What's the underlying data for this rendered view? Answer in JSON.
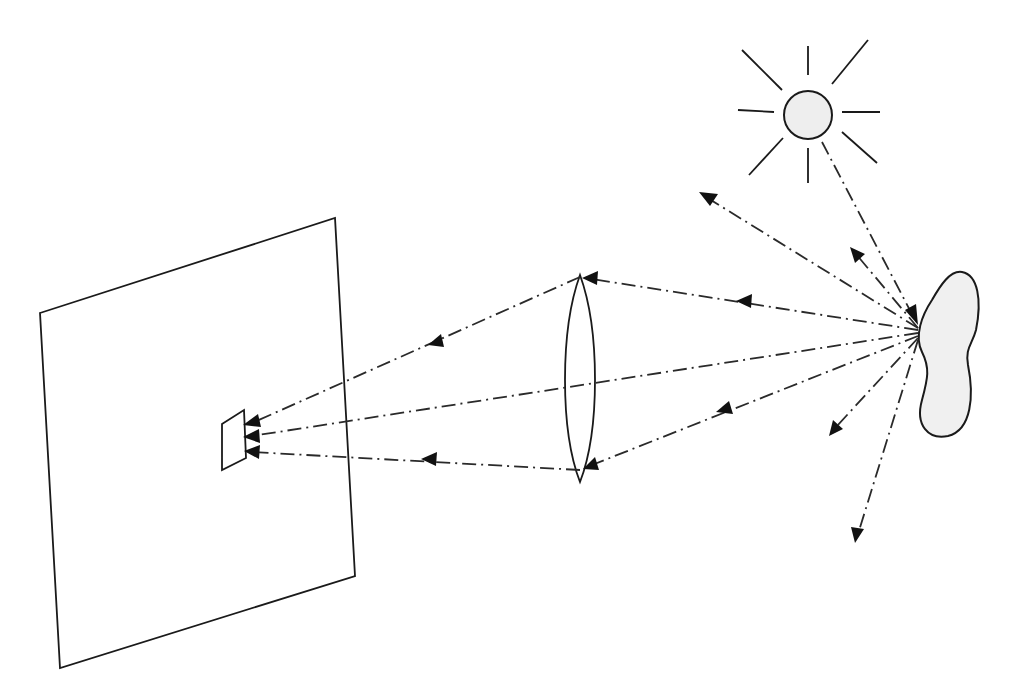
{
  "diagram": {
    "title": "",
    "colors": {
      "line": "#1a1a1a",
      "ray": "#2a2a2a",
      "sun_fill": "#eeeeee",
      "object_fill": "#f0f0f0",
      "background": "#ffffff"
    },
    "elements": {
      "sun": {
        "name": "light-source-sun",
        "cx": 808,
        "cy": 115,
        "r": 26
      },
      "object": {
        "name": "illuminated-object"
      },
      "lens": {
        "name": "convex-lens",
        "x": 580,
        "top": 275,
        "bottom": 482
      },
      "screen": {
        "name": "image-plane-screen",
        "points": "40,313 335,218 355,576 60,668"
      },
      "image": {
        "name": "projected-image",
        "points": "222,424 244,410 246,458 222,470"
      }
    },
    "rays": [
      {
        "name": "incident-ray",
        "from": [
          822,
          142
        ],
        "to": [
          918,
          325
        ]
      },
      {
        "name": "scattered-ray-up-left",
        "from": [
          918,
          328
        ],
        "to": [
          699,
          193
        ]
      },
      {
        "name": "scattered-ray-up",
        "from": [
          918,
          328
        ],
        "to": [
          851,
          248
        ]
      },
      {
        "name": "ray-to-lens-top",
        "from": [
          918,
          330
        ],
        "to": [
          580,
          277
        ]
      },
      {
        "name": "ray-through-lens-center",
        "from": [
          918,
          333
        ],
        "to": [
          245,
          437
        ]
      },
      {
        "name": "ray-to-lens-bottom",
        "from": [
          918,
          336
        ],
        "to": [
          580,
          470
        ]
      },
      {
        "name": "scattered-ray-down-left",
        "from": [
          918,
          338
        ],
        "to": [
          831,
          433
        ]
      },
      {
        "name": "scattered-ray-down",
        "from": [
          918,
          340
        ],
        "to": [
          856,
          542
        ]
      },
      {
        "name": "refracted-ray-top",
        "from": [
          580,
          277
        ],
        "to": [
          245,
          424
        ]
      },
      {
        "name": "refracted-ray-bottom",
        "from": [
          580,
          470
        ],
        "to": [
          245,
          452
        ]
      }
    ]
  }
}
